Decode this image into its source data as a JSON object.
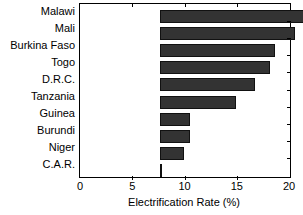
{
  "chart_data": {
    "type": "bar",
    "orientation": "horizontal",
    "title": "",
    "xlabel": "Electrification Rate (%)",
    "ylabel": "",
    "xlim": [
      0,
      20
    ],
    "xticks": [
      0,
      5,
      10,
      15,
      20
    ],
    "xtick_labels": [
      "0",
      "5",
      "10",
      "15",
      "20"
    ],
    "grid": false,
    "legend": null,
    "bar_color": "#333333",
    "categories": [
      "Malawi",
      "Mali",
      "Burkina Faso",
      "Togo",
      "D.R.C.",
      "Tanzania",
      "Guinea",
      "Burundi",
      "Niger",
      "C.A.R."
    ],
    "values": [
      14.2,
      12.9,
      11.0,
      10.5,
      9.1,
      7.3,
      2.9,
      2.9,
      2.3,
      0.1
    ]
  }
}
